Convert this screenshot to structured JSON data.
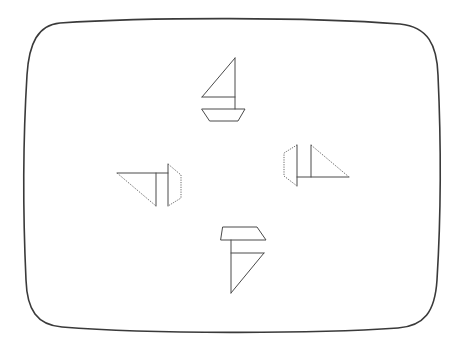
{
  "figure": {
    "frame_color": "#3a3a3a",
    "stroke_color": "#4a4a4a"
  },
  "boats": [
    {
      "id": "top",
      "orientation": "up",
      "rotation_deg": 0
    },
    {
      "id": "left",
      "orientation": "left",
      "rotation_deg": 270
    },
    {
      "id": "right",
      "orientation": "right",
      "rotation_deg": 90
    },
    {
      "id": "bottom",
      "orientation": "down",
      "rotation_deg": 180
    }
  ]
}
